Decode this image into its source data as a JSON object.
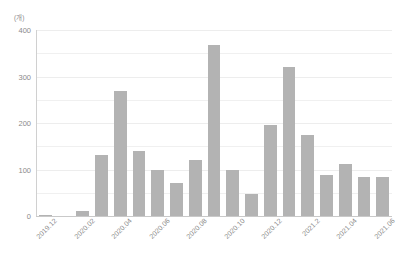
{
  "chart_data": {
    "type": "bar",
    "title": "",
    "subtitle": "",
    "unit_label": "(개)",
    "xlabel": "",
    "ylabel": "",
    "ylim": [
      0,
      400
    ],
    "y_ticks": [
      0,
      100,
      200,
      300,
      400
    ],
    "y_tick_labels": [
      "0",
      "100",
      "200",
      "300",
      "400"
    ],
    "y_minor_step": 50,
    "grid": true,
    "grid_axis": "y",
    "legend": false,
    "legend_position": "none",
    "x_label_rotation": -45,
    "x_tick_labels_shown": [
      "2019.12",
      "2020.02",
      "2020.04",
      "2020.06",
      "2020.08",
      "2020.10",
      "2020.12",
      "2021.2",
      "2021.04",
      "2021.06"
    ],
    "categories": [
      "2019.12",
      "2020.01",
      "2020.02",
      "2020.03",
      "2020.04",
      "2020.05",
      "2020.06",
      "2020.07",
      "2020.08",
      "2020.09",
      "2020.10",
      "2020.11",
      "2020.12",
      "2021.01",
      "2021.02",
      "2021.03",
      "2021.04",
      "2021.05",
      "2021.06"
    ],
    "values": [
      2,
      0,
      10,
      132,
      268,
      140,
      100,
      72,
      121,
      368,
      98,
      48,
      196,
      320,
      175,
      88,
      112,
      83,
      83
    ],
    "colors": {
      "bar": "#b3b3b3",
      "grid": "#f0f0f0",
      "axis": "#c9c9c9",
      "text": "#8a8a8a",
      "background": "#ffffff"
    }
  }
}
